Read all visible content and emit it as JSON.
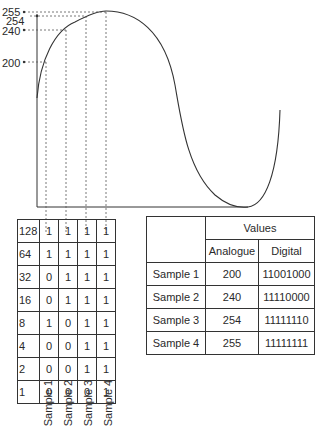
{
  "y_labels": [
    {
      "value": "255",
      "y": 7,
      "x": 2
    },
    {
      "value": "254",
      "y": 16,
      "x": 6
    },
    {
      "value": "240",
      "y": 26,
      "x": 2
    },
    {
      "value": "200",
      "y": 58,
      "x": 2
    }
  ],
  "bit_table": {
    "weights": [
      "128",
      "64",
      "32",
      "16",
      "8",
      "4",
      "2",
      "1"
    ],
    "samples": [
      {
        "label": "Sample 1",
        "bits": [
          "1",
          "1",
          "0",
          "0",
          "1",
          "0",
          "0",
          "0"
        ]
      },
      {
        "label": "Sample 2",
        "bits": [
          "1",
          "1",
          "1",
          "1",
          "0",
          "0",
          "0",
          "0"
        ]
      },
      {
        "label": "Sample 3",
        "bits": [
          "1",
          "1",
          "1",
          "1",
          "1",
          "1",
          "1",
          "0"
        ]
      },
      {
        "label": "Sample 4",
        "bits": [
          "1",
          "1",
          "1",
          "1",
          "1",
          "1",
          "1",
          "1"
        ]
      }
    ]
  },
  "values_table": {
    "header_group": "Values",
    "col_analogue": "Analogue",
    "col_digital": "Digital",
    "rows": [
      {
        "label": "Sample 1",
        "analogue": "200",
        "digital": "11001000"
      },
      {
        "label": "Sample 2",
        "analogue": "240",
        "digital": "11110000"
      },
      {
        "label": "Sample 3",
        "analogue": "254",
        "digital": "11111110"
      },
      {
        "label": "Sample 4",
        "analogue": "255",
        "digital": "11111111"
      }
    ]
  },
  "chart_data": {
    "type": "line",
    "title": "",
    "xlabel": "",
    "ylabel": "",
    "y_ticks": [
      200,
      240,
      254,
      255
    ],
    "samples": [
      {
        "name": "Sample 1",
        "analogue": 200,
        "digital": "11001000"
      },
      {
        "name": "Sample 2",
        "analogue": 240,
        "digital": "11110000"
      },
      {
        "name": "Sample 3",
        "analogue": 254,
        "digital": "11111110"
      },
      {
        "name": "Sample 4",
        "analogue": 255,
        "digital": "11111111"
      }
    ],
    "bit_weights": [
      128,
      64,
      32,
      16,
      8,
      4,
      2,
      1
    ]
  }
}
